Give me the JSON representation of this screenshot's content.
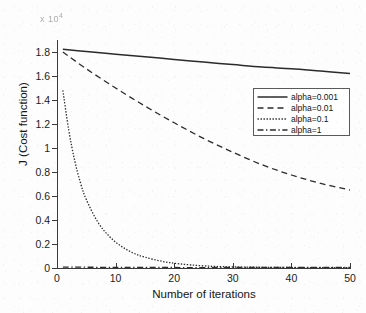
{
  "chart_data": {
    "type": "line",
    "title": "",
    "xlabel": "Number of iterations",
    "ylabel": "J (Cost function)",
    "xlim": [
      0,
      50
    ],
    "ylim": [
      0,
      1.9
    ],
    "xticks": [
      "0",
      "10",
      "20",
      "30",
      "40",
      "50"
    ],
    "xtick_values": [
      0,
      10,
      20,
      30,
      40,
      50
    ],
    "yticks": [
      "0",
      "0.2",
      "0.4",
      "0.6",
      "0.8",
      "1",
      "1.2",
      "1.4",
      "1.6",
      "1.8"
    ],
    "ytick_values": [
      0,
      0.2,
      0.4,
      0.6,
      0.8,
      1.0,
      1.2,
      1.4,
      1.6,
      1.8
    ],
    "grid": false,
    "legend_position": "upper-right-inside",
    "exponent_annotation": "x 10",
    "exponent_power": "4",
    "line_color": "#2b2b2b",
    "series": [
      {
        "name": "alpha=0.001",
        "style": "solid",
        "x": [
          1,
          5,
          10,
          15,
          20,
          25,
          30,
          35,
          40,
          45,
          50
        ],
        "values": [
          1.822,
          1.804,
          1.782,
          1.76,
          1.738,
          1.716,
          1.695,
          1.674,
          1.661,
          1.641,
          1.621
        ]
      },
      {
        "name": "alpha=0.01",
        "style": "dashed",
        "x": [
          1,
          5,
          10,
          15,
          20,
          25,
          30,
          35,
          40,
          45,
          50
        ],
        "values": [
          1.8,
          1.66,
          1.5,
          1.35,
          1.21,
          1.08,
          0.965,
          0.86,
          0.775,
          0.705,
          0.65
        ]
      },
      {
        "name": "alpha=0.1",
        "style": "dotted",
        "x": [
          1,
          2,
          3,
          4,
          5,
          7,
          9,
          11,
          13,
          15,
          18,
          21,
          25,
          30,
          40,
          50
        ],
        "values": [
          1.48,
          1.15,
          0.9,
          0.71,
          0.57,
          0.38,
          0.26,
          0.18,
          0.125,
          0.09,
          0.055,
          0.034,
          0.018,
          0.009,
          0.004,
          0.002
        ]
      },
      {
        "name": "alpha=1",
        "style": "dashdot",
        "x": [
          1,
          10,
          20,
          30,
          40,
          50
        ],
        "values": [
          0.008,
          0.005,
          0.004,
          0.004,
          0.004,
          0.004
        ]
      }
    ]
  },
  "legend": {
    "entries": [
      {
        "label": "alpha=0.001",
        "style": "solid"
      },
      {
        "label": "alpha=0.01",
        "style": "dashed"
      },
      {
        "label": "alpha=0.1",
        "style": "dotted"
      },
      {
        "label": "alpha=1",
        "style": "dashdot"
      }
    ]
  }
}
